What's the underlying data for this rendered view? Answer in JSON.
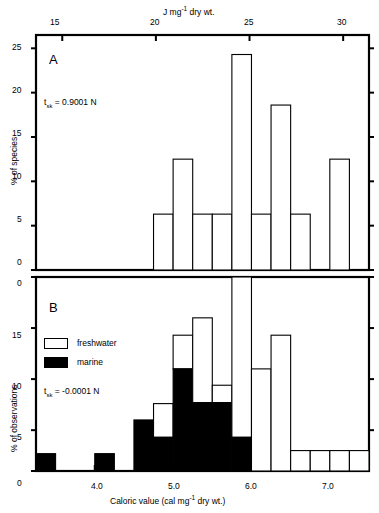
{
  "figure": {
    "top_axis_title_pre": "J mg",
    "top_axis_title_sup": "-1",
    "top_axis_title_post": " dry wt.",
    "bottom_axis_title_pre": "Caloric value   (cal mg",
    "bottom_axis_title_sup": "-1",
    "bottom_axis_title_post": " dry wt.)",
    "top_ticks": [
      "15",
      "20",
      "25",
      "30"
    ],
    "bottom_ticks": [
      "4.0",
      "5.0",
      "6.0",
      "7.0"
    ],
    "line_color": "#000000",
    "fill_freshwater": "#ffffff",
    "fill_marine": "#000000"
  },
  "panelA": {
    "letter": "A",
    "stat_symbol": "t",
    "stat_sub": "sk",
    "stat_value": "= 0.9001  N",
    "ylabel": "% of species",
    "yticks": [
      "0",
      "5",
      "10",
      "15",
      "20",
      "25"
    ]
  },
  "panelB": {
    "letter": "B",
    "stat_symbol": "t",
    "stat_sub": "sk",
    "stat_value": "= -0.0001  N",
    "ylabel": "% of observations",
    "yticks": [
      "0",
      "5",
      "10",
      "15"
    ],
    "legend": [
      {
        "label": "freshwater",
        "fill": "#ffffff"
      },
      {
        "label": "marine",
        "fill": "#000000"
      }
    ]
  },
  "chart_data": [
    {
      "type": "bar",
      "title": "A",
      "xlabel": "Caloric value (cal mg-1 dry wt.)",
      "ylabel": "% of species",
      "ylim": [
        0,
        26.5
      ],
      "xlim": [
        3.25,
        7.5
      ],
      "bin_width": 0.25,
      "grid": false,
      "legend": "none",
      "annotation": "t_sk = 0.9001 N",
      "top_axis": {
        "label": "J mg-1 dry wt.",
        "ticks": [
          15,
          20,
          25,
          30
        ]
      },
      "bins": [
        {
          "x0": 4.75,
          "x1": 5.0,
          "value": 6.3
        },
        {
          "x0": 5.0,
          "x1": 5.25,
          "value": 12.5
        },
        {
          "x0": 5.25,
          "x1": 5.5,
          "value": 6.3
        },
        {
          "x0": 5.5,
          "x1": 5.75,
          "value": 6.3
        },
        {
          "x0": 5.75,
          "x1": 6.0,
          "value": 24.3
        },
        {
          "x0": 6.0,
          "x1": 6.25,
          "value": 6.3
        },
        {
          "x0": 6.25,
          "x1": 6.5,
          "value": 18.6
        },
        {
          "x0": 6.5,
          "x1": 6.75,
          "value": 6.3
        },
        {
          "x0": 6.75,
          "x1": 7.0,
          "value": 0
        },
        {
          "x0": 7.0,
          "x1": 7.25,
          "value": 12.5
        }
      ]
    },
    {
      "type": "bar",
      "title": "B",
      "xlabel": "Caloric value (cal mg-1 dry wt.)",
      "ylabel": "% of observations",
      "ylim": [
        0,
        19
      ],
      "xlim": [
        3.25,
        7.5
      ],
      "bin_width": 0.25,
      "grid": false,
      "legend": "inside-left",
      "annotation": "t_sk = -0.0001 N",
      "series": [
        {
          "name": "marine",
          "color": "#000000"
        },
        {
          "name": "freshwater",
          "color": "#ffffff"
        }
      ],
      "bins": [
        {
          "x0": 3.25,
          "x1": 3.5,
          "marine": 1.7,
          "freshwater": 0
        },
        {
          "x0": 3.5,
          "x1": 3.75,
          "marine": 0,
          "freshwater": 0
        },
        {
          "x0": 3.75,
          "x1": 4.0,
          "marine": 0,
          "freshwater": 0
        },
        {
          "x0": 4.0,
          "x1": 4.25,
          "marine": 1.7,
          "freshwater": 0
        },
        {
          "x0": 4.25,
          "x1": 4.5,
          "marine": 0,
          "freshwater": 0
        },
        {
          "x0": 4.5,
          "x1": 4.75,
          "marine": 5.0,
          "freshwater": 0
        },
        {
          "x0": 4.75,
          "x1": 5.0,
          "marine": 3.3,
          "freshwater": 3.3
        },
        {
          "x0": 5.0,
          "x1": 5.25,
          "marine": 10.0,
          "freshwater": 3.3
        },
        {
          "x0": 5.25,
          "x1": 5.5,
          "marine": 6.7,
          "freshwater": 8.3
        },
        {
          "x0": 5.5,
          "x1": 5.75,
          "marine": 6.7,
          "freshwater": 1.7
        },
        {
          "x0": 5.75,
          "x1": 6.0,
          "marine": 3.3,
          "freshwater": 15.7
        },
        {
          "x0": 6.0,
          "x1": 6.25,
          "marine": 0,
          "freshwater": 10.0
        },
        {
          "x0": 6.25,
          "x1": 6.5,
          "marine": 0,
          "freshwater": 13.3
        },
        {
          "x0": 6.5,
          "x1": 6.75,
          "marine": 0,
          "freshwater": 2.0
        },
        {
          "x0": 6.75,
          "x1": 7.0,
          "marine": 0,
          "freshwater": 2.0
        },
        {
          "x0": 7.0,
          "x1": 7.25,
          "marine": 0,
          "freshwater": 2.0
        },
        {
          "x0": 7.25,
          "x1": 7.5,
          "marine": 0,
          "freshwater": 2.0
        }
      ]
    }
  ]
}
